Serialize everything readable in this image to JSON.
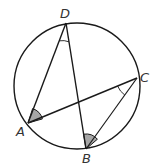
{
  "figure": {
    "type": "inscribed-angles-circle",
    "circle": {
      "cx": 77,
      "cy": 86,
      "r": 63
    },
    "points": {
      "D": {
        "label": "D",
        "x": 66,
        "y": 23
      },
      "C": {
        "label": "C",
        "x": 137,
        "y": 78
      },
      "A": {
        "label": "A",
        "x": 28,
        "y": 123
      },
      "B": {
        "label": "B",
        "x": 86,
        "y": 149
      }
    },
    "segments": [
      [
        "D",
        "A"
      ],
      [
        "D",
        "B"
      ],
      [
        "A",
        "C"
      ],
      [
        "C",
        "B"
      ]
    ],
    "angle_marks": {
      "A": {
        "style": "shaded",
        "between": [
          "D",
          "C"
        ]
      },
      "B": {
        "style": "shaded",
        "between": [
          "D",
          "C"
        ]
      },
      "D": {
        "style": "arc",
        "between": [
          "A",
          "B"
        ]
      },
      "C": {
        "style": "arc",
        "between": [
          "A",
          "B"
        ]
      }
    },
    "colors": {
      "stroke": "#1a1a1a",
      "shade": "#a6a6a6",
      "label": "#333333"
    }
  }
}
